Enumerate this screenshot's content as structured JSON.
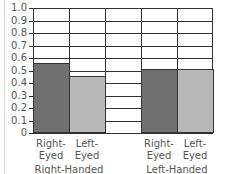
{
  "chart_data": {
    "type": "bar",
    "title": "",
    "xlabel": "",
    "ylabel": "",
    "ylim": [
      0,
      1.0
    ],
    "yticks": [
      "0",
      "0.1",
      "0.2",
      "0.3",
      "0.4",
      "0.5",
      "0.6",
      "0.7",
      "0.8",
      "0.9",
      "1.0"
    ],
    "grid": true,
    "groups": [
      "Right-Handed",
      "Left-Handed"
    ],
    "categories": [
      "Right-Eyed",
      "Left-Eyed",
      "Right-Eyed",
      "Left-Eyed"
    ],
    "category_lines": [
      [
        "Right-",
        "Eyed"
      ],
      [
        "Left-",
        "Eyed"
      ],
      [
        "Right-",
        "Eyed"
      ],
      [
        "Left-",
        "Eyed"
      ]
    ],
    "values": [
      0.55,
      0.45,
      0.5,
      0.5
    ],
    "series": [
      {
        "name": "Right-Handed",
        "values": {
          "Right-Eyed": 0.55,
          "Left-Eyed": 0.45
        }
      },
      {
        "name": "Left-Handed",
        "values": {
          "Right-Eyed": 0.5,
          "Left-Eyed": 0.5
        }
      }
    ],
    "colors": {
      "right_eyed": "#707070",
      "left_eyed": "#b8b8b8",
      "grid": "#333333"
    }
  }
}
